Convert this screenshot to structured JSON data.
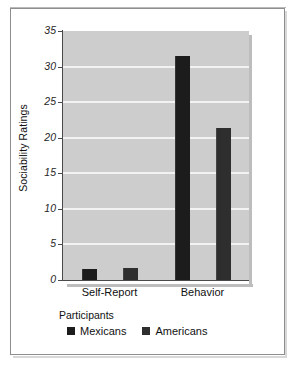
{
  "chart_data": {
    "type": "bar",
    "title": "",
    "xlabel": "",
    "ylabel": "Sociability Ratings",
    "categories": [
      "Self-Report",
      "Behavior"
    ],
    "series": [
      {
        "name": "Mexicans",
        "values": [
          1.6,
          31.5
        ],
        "color": "#1c1c1c"
      },
      {
        "name": "Americans",
        "values": [
          1.7,
          21.3
        ],
        "color": "#2e2e2e"
      }
    ],
    "ylim": [
      0,
      35
    ],
    "yticks": [
      0,
      5,
      10,
      15,
      20,
      25,
      30,
      35
    ],
    "ytick_labels": [
      "0",
      "5",
      "10",
      "15",
      "20",
      "25",
      "30",
      "35"
    ],
    "grid": true,
    "grid_axis": "y",
    "legend": {
      "title": "Participants",
      "position": "bottom-left"
    },
    "plot_background": "#cdcdcd",
    "gridline_color": "#f2f2f2",
    "axis_color": "#4a4a4a",
    "figure_background": "#ffffff"
  },
  "legend": {
    "title": "Participants",
    "entries": [
      {
        "label": "Mexicans",
        "color": "#1c1c1c"
      },
      {
        "label": "Americans",
        "color": "#2e2e2e"
      }
    ]
  }
}
